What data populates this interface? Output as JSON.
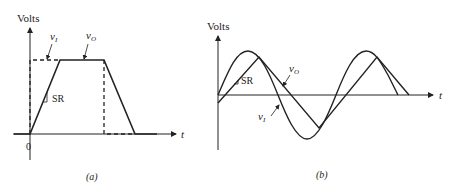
{
  "panel_a": {
    "y_label": "Volts",
    "x_label": "t",
    "origin_label": "0",
    "input_label": "v",
    "input_sub": "I",
    "output_label": "v",
    "output_sub": "O",
    "slope_label": "SR",
    "caption": "(a)"
  },
  "panel_b": {
    "y_label": "Volts",
    "x_label": "t",
    "input_label": "v",
    "input_sub": "I",
    "output_label": "v",
    "output_sub": "O",
    "slope_label": "SR",
    "caption": "(b)"
  },
  "colors": {
    "line": "#222222",
    "background": "#ffffff"
  }
}
